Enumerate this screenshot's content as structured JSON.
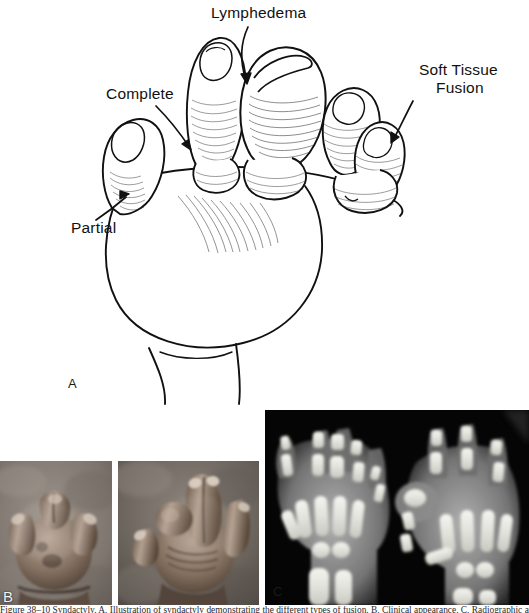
{
  "figure": {
    "type": "medical-illustration-figure",
    "panels": [
      {
        "letter": "A",
        "kind": "line-drawing",
        "subject": "Infant hand with syndactyly — dorsal view",
        "annotations": [
          {
            "label": "Complete",
            "target": "third-web-space"
          },
          {
            "label": "Lymphedema",
            "target": "swollen-middle-finger"
          },
          {
            "label": "Soft Tissue\nFusion",
            "target": "ulnar-border-fused-digits"
          },
          {
            "label": "Partial",
            "target": "thumb-index-web-space"
          }
        ]
      },
      {
        "letter": "B",
        "kind": "clinical-photograph-pair",
        "subject": "Clinical photographs of affected hands"
      },
      {
        "letter": "C",
        "kind": "radiograph",
        "subject": "Anteroposterior radiograph of both hands"
      }
    ]
  },
  "annotations": {
    "complete": "Complete",
    "lymphedema": "Lymphedema",
    "soft_tissue_line1": "Soft Tissue",
    "soft_tissue_line2": "Fusion",
    "partial": "Partial"
  },
  "panel_letters": {
    "a": "A",
    "b": "B",
    "c": "C"
  },
  "caption": {
    "text": "Figure 38–10  Syndactyly. A, Illustration of syndactyly demonstrating the different types of fusion. B, Clinical appearance. C, Radiographic appearance."
  },
  "colors": {
    "page_background": "#ffffff",
    "ink": "#111111",
    "photo_skin_light": "#cfc4bb",
    "photo_skin_mid": "#8c7a6e",
    "photo_skin_dark": "#4a3f38",
    "radiograph_background": "#000000",
    "radiograph_bone": "#f2f2ee",
    "radiograph_soft_tissue": "#8d8d8d",
    "panel_letter": "#f2f2f2"
  }
}
